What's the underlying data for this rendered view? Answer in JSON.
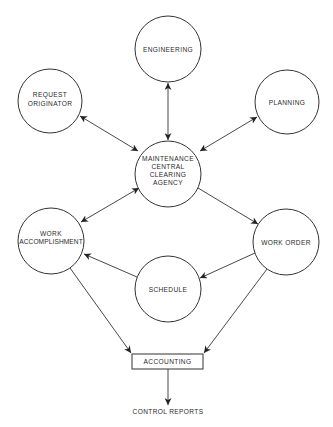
{
  "diagram": {
    "type": "flow-diagram",
    "line_color": "#333333",
    "text_color": "#2a2a2a",
    "background": "#ffffff",
    "nodes": {
      "engineering": {
        "shape": "circle",
        "lines": [
          "ENGINEERING"
        ]
      },
      "request_originator": {
        "shape": "circle",
        "lines": [
          "REQUEST",
          "ORIGINATOR"
        ]
      },
      "planning": {
        "shape": "circle",
        "lines": [
          "PLANNING"
        ]
      },
      "clearing_agency": {
        "shape": "circle",
        "lines": [
          "MAINTENANCE",
          "CENTRAL",
          "CLEARING",
          "AGENCY"
        ]
      },
      "work_accomplishment": {
        "shape": "circle",
        "lines": [
          "WORK",
          "ACCOMPLISHMENT"
        ]
      },
      "work_order": {
        "shape": "circle",
        "lines": [
          "WORK ORDER"
        ]
      },
      "schedule": {
        "shape": "circle",
        "lines": [
          "SCHEDULE"
        ]
      },
      "accounting": {
        "shape": "rectangle",
        "lines": [
          "ACCOUNTING"
        ]
      },
      "control_reports": {
        "shape": "text",
        "lines": [
          "CONTROL REPORTS"
        ]
      }
    },
    "edges": [
      {
        "from": "engineering",
        "to": "clearing_agency",
        "direction": "both"
      },
      {
        "from": "request_originator",
        "to": "clearing_agency",
        "direction": "both"
      },
      {
        "from": "planning",
        "to": "clearing_agency",
        "direction": "both"
      },
      {
        "from": "work_accomplishment",
        "to": "clearing_agency",
        "direction": "both"
      },
      {
        "from": "clearing_agency",
        "to": "work_order",
        "direction": "forward"
      },
      {
        "from": "work_order",
        "to": "schedule",
        "direction": "forward"
      },
      {
        "from": "schedule",
        "to": "work_accomplishment",
        "direction": "forward"
      },
      {
        "from": "work_accomplishment",
        "to": "accounting",
        "direction": "forward"
      },
      {
        "from": "work_order",
        "to": "accounting",
        "direction": "forward"
      },
      {
        "from": "accounting",
        "to": "control_reports",
        "direction": "forward"
      }
    ]
  }
}
